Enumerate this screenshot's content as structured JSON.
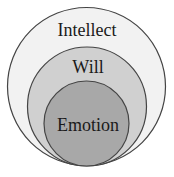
{
  "diagram": {
    "type": "nested-circles",
    "background": "#ffffff",
    "stroke_color": "#444444",
    "circles": [
      {
        "id": "outer",
        "label": "Intellect",
        "fill": "#f2f2f2",
        "cx": 86.5,
        "cy": 86.5,
        "r": 79,
        "label_x": 87,
        "label_y": 36,
        "font_size": 18
      },
      {
        "id": "middle",
        "label": "Will",
        "fill": "#d0d0d0",
        "cx": 87,
        "cy": 106.5,
        "r": 59.5,
        "label_x": 88,
        "label_y": 73,
        "font_size": 18
      },
      {
        "id": "inner",
        "label": "Emotion",
        "fill": "#a8a8a8",
        "cx": 86.5,
        "cy": 123.5,
        "r": 42.5,
        "label_x": 88,
        "label_y": 131,
        "font_size": 18
      }
    ]
  }
}
